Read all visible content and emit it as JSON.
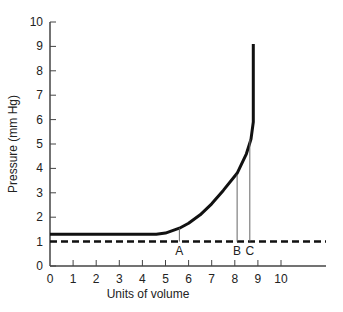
{
  "chart_data": {
    "type": "line",
    "title": "",
    "xlabel": "Units of volume",
    "ylabel": "Pressure (mm Hg)",
    "xlim": [
      0,
      11.8
    ],
    "ylim": [
      0,
      10
    ],
    "x_ticks": [
      "0",
      "1",
      "2",
      "3",
      "4",
      "5",
      "6",
      "7",
      "8",
      "9",
      "10"
    ],
    "y_ticks": [
      "0",
      "1",
      "2",
      "3",
      "4",
      "5",
      "6",
      "7",
      "8",
      "9",
      "10"
    ],
    "grid": false,
    "legend": null,
    "series": [
      {
        "name": "pressure-volume curve",
        "style": "solid",
        "points": [
          [
            0,
            1.3
          ],
          [
            4.6,
            1.3
          ],
          [
            5.0,
            1.35
          ],
          [
            5.6,
            1.55
          ],
          [
            6.0,
            1.75
          ],
          [
            6.5,
            2.1
          ],
          [
            7.0,
            2.55
          ],
          [
            7.5,
            3.1
          ],
          [
            8.1,
            3.8
          ],
          [
            8.5,
            4.6
          ],
          [
            8.7,
            5.2
          ],
          [
            8.8,
            5.9
          ],
          [
            8.8,
            9.1
          ]
        ]
      },
      {
        "name": "baseline",
        "style": "dashed",
        "points": [
          [
            0,
            1.0
          ],
          [
            11.8,
            1.0
          ]
        ]
      }
    ],
    "annotations": [
      {
        "label": "A",
        "x": 5.6,
        "y": 1.55
      },
      {
        "label": "B",
        "x": 8.1,
        "y": 3.75
      },
      {
        "label": "C",
        "x": 8.65,
        "y": 5.2
      }
    ]
  }
}
